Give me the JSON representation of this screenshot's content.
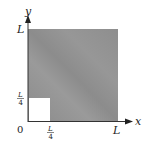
{
  "diagram": {
    "type": "region-plot",
    "axes": {
      "x_label": "x",
      "y_label": "y",
      "origin_label": "0",
      "x_ticks": [
        {
          "label_num": "L",
          "label_den": "4",
          "value": 0.25
        },
        {
          "label": "L",
          "value": 1
        }
      ],
      "y_ticks": [
        {
          "label_num": "L",
          "label_den": "4",
          "value": 0.25
        },
        {
          "label": "L",
          "value": 1
        }
      ]
    },
    "regions": {
      "shaded": {
        "description": "square [0,L]x[0,L] minus corner square",
        "color": "#8f8f8f"
      },
      "excluded": {
        "description": "square [0,L/4]x[0,L/4]",
        "color": "#ffffff"
      }
    }
  }
}
